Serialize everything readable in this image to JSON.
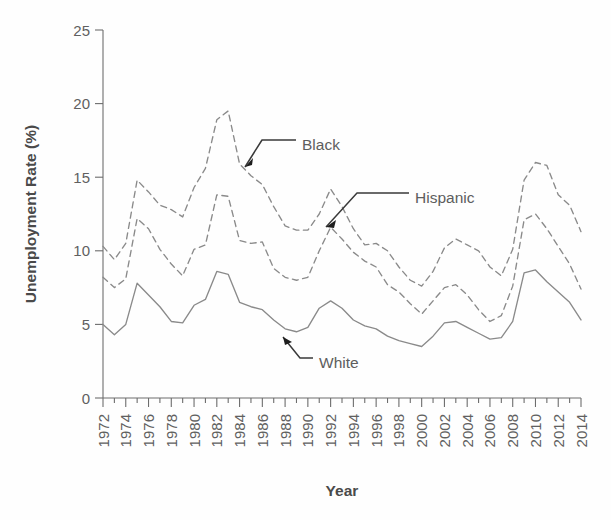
{
  "chart_data": {
    "type": "line",
    "title": "",
    "xlabel": "Year",
    "ylabel": "Unemployment Rate (%)",
    "xlim": [
      1972,
      2014
    ],
    "ylim": [
      0,
      25
    ],
    "grid": false,
    "legend_position": "inline-annotations",
    "x": [
      1972,
      1973,
      1974,
      1975,
      1976,
      1977,
      1978,
      1979,
      1980,
      1981,
      1982,
      1983,
      1984,
      1985,
      1986,
      1987,
      1988,
      1989,
      1990,
      1991,
      1992,
      1993,
      1994,
      1995,
      1996,
      1997,
      1998,
      1999,
      2000,
      2001,
      2002,
      2003,
      2004,
      2005,
      2006,
      2007,
      2008,
      2009,
      2010,
      2011,
      2012,
      2013,
      2014
    ],
    "xticks": [
      "1972",
      "1974",
      "1976",
      "1978",
      "1980",
      "1982",
      "1984",
      "1986",
      "1988",
      "1990",
      "1992",
      "1994",
      "1996",
      "1998",
      "2000",
      "2002",
      "2004",
      "2006",
      "2008",
      "2010",
      "2012",
      "2014"
    ],
    "yticks": [
      "0",
      "5",
      "10",
      "15",
      "20",
      "25"
    ],
    "series": [
      {
        "name": "Black",
        "style": "dashed",
        "color": "#8a8a8a",
        "values": [
          10.3,
          9.4,
          10.5,
          14.8,
          14.0,
          13.1,
          12.8,
          12.3,
          14.3,
          15.6,
          18.9,
          19.5,
          15.9,
          15.1,
          14.5,
          13.0,
          11.7,
          11.4,
          11.4,
          12.5,
          14.2,
          13.0,
          11.5,
          10.4,
          10.5,
          10.0,
          8.9,
          8.0,
          7.6,
          8.6,
          10.2,
          10.8,
          10.4,
          10.0,
          8.9,
          8.3,
          10.1,
          14.8,
          16.0,
          15.8,
          13.8,
          13.1,
          11.3
        ]
      },
      {
        "name": "Hispanic",
        "style": "dashed",
        "color": "#8a8a8a",
        "values": [
          8.2,
          7.5,
          8.1,
          12.2,
          11.5,
          10.1,
          9.1,
          8.3,
          10.1,
          10.4,
          13.8,
          13.7,
          10.7,
          10.5,
          10.6,
          8.8,
          8.2,
          8.0,
          8.2,
          10.0,
          11.6,
          10.8,
          9.9,
          9.3,
          8.9,
          7.7,
          7.2,
          6.4,
          5.7,
          6.6,
          7.5,
          7.7,
          7.0,
          6.0,
          5.2,
          5.6,
          7.6,
          12.1,
          12.5,
          11.5,
          10.3,
          9.1,
          7.4
        ]
      },
      {
        "name": "White",
        "style": "solid",
        "color": "#8a8a8a",
        "values": [
          5.0,
          4.3,
          5.0,
          7.8,
          7.0,
          6.2,
          5.2,
          5.1,
          6.3,
          6.7,
          8.6,
          8.4,
          6.5,
          6.2,
          6.0,
          5.3,
          4.7,
          4.5,
          4.8,
          6.1,
          6.6,
          6.1,
          5.3,
          4.9,
          4.7,
          4.2,
          3.9,
          3.7,
          3.5,
          4.2,
          5.1,
          5.2,
          4.8,
          4.4,
          4.0,
          4.1,
          5.2,
          8.5,
          8.7,
          7.9,
          7.2,
          6.5,
          5.3
        ]
      }
    ],
    "annotations": [
      {
        "label": "Black",
        "target_year": 1985,
        "target_value": 15.9,
        "label_x": 302,
        "label_y": 145,
        "leader": "M296,140 L262,140 L245,167",
        "arrow": "M245,167 L253,158 L252,165 Z"
      },
      {
        "label": "Hispanic",
        "target_year": 1992.5,
        "target_value": 11.2,
        "label_x": 415,
        "label_y": 198,
        "leader": "M409,193 L357,193 L326,227",
        "arrow": "M326,227 L336,220 L334,228 Z"
      },
      {
        "label": "White",
        "target_year": 1989.5,
        "target_value": 4.6,
        "label_x": 319,
        "label_y": 363,
        "leader": "M313,358 L300,358 L283,337",
        "arrow": "M283,337 L292,342 L285,345 Z"
      }
    ]
  },
  "axis": {
    "ylabel": "Unemployment Rate (%)",
    "xlabel": "Year"
  }
}
